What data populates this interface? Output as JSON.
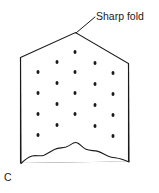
{
  "figure": {
    "panel_letter": "C",
    "background_color": "#ffffff",
    "ink_color": "#1a1a1a",
    "width": 159,
    "height": 193
  },
  "annotations": [
    {
      "id": "sharp-fold",
      "label": "Sharp fold",
      "text_x": 96,
      "text_y": 20,
      "leader": "M 95,17 L 76,33"
    }
  ],
  "specimen": {
    "name": "folded-sheet-specimen",
    "outline_path": "M 20.5,57.5 L 75.5,32.5 L 128.5,63.5 L 128.5,162.0 L 20.5,163.5 Z",
    "fold_ridge_path": "M 75.5,32.5 L 75.5,33.0",
    "torn_edge_path": "M 21,163.5 C 24,160.5 28,157.2 32,156.0 C 36,155.0 40,156.5 44,155.2 C 48,153.6 51,150.8 55,149.2 C 59,147.6 62,148.2 66,147.0 C 69,146.0 71,144.2 73.5,143.0 C 75,142.3 76.5,142.2 78,143.2 C 81,145.2 83,148.0 86,149.3 C 90,151.0 94,150.2 98,151.4 C 102,152.6 105,155.0 109,156.4 C 113,157.8 117,157.6 121,159.0 C 124.5,160.2 127,161.2 129,162.0",
    "left_edge_path": "M 20.5,57.5 L 21,163.5",
    "right_edge_path": "M 128.5,63.5 L 129,162.0"
  },
  "pores": {
    "name": "pore-dots",
    "radius_x": 1.5,
    "radius_y": 2.1,
    "points": [
      {
        "x": 75,
        "y": 52
      },
      {
        "x": 57,
        "y": 62
      },
      {
        "x": 95,
        "y": 63
      },
      {
        "x": 38,
        "y": 72
      },
      {
        "x": 75,
        "y": 72
      },
      {
        "x": 113,
        "y": 73
      },
      {
        "x": 57,
        "y": 83
      },
      {
        "x": 95,
        "y": 84
      },
      {
        "x": 38,
        "y": 93
      },
      {
        "x": 75,
        "y": 93
      },
      {
        "x": 113,
        "y": 94
      },
      {
        "x": 57,
        "y": 104
      },
      {
        "x": 95,
        "y": 105
      },
      {
        "x": 38,
        "y": 114
      },
      {
        "x": 75,
        "y": 114
      },
      {
        "x": 113,
        "y": 115
      },
      {
        "x": 57,
        "y": 125
      },
      {
        "x": 95,
        "y": 126
      },
      {
        "x": 38,
        "y": 135
      },
      {
        "x": 113,
        "y": 136
      }
    ]
  }
}
